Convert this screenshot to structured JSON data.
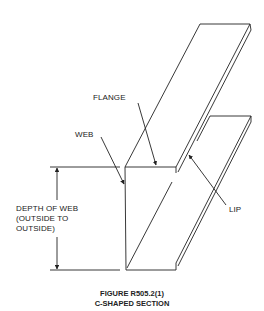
{
  "figure": {
    "title": "FIGURE R505.2(1)",
    "subtitle": "C-SHAPED SECTION"
  },
  "labels": {
    "flange": "FLANGE",
    "web": "WEB",
    "lip": "LIP",
    "depth_line1": "DEPTH OF WEB",
    "depth_line2": "(OUTSIDE TO",
    "depth_line3": "OUTSIDE)"
  },
  "colors": {
    "line": "#222222",
    "background": "#ffffff"
  }
}
